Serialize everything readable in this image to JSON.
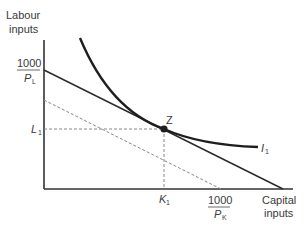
{
  "diagram": {
    "type": "isoquant-isocost",
    "y_axis_label_line1": "Labour",
    "y_axis_label_line2": "inputs",
    "x_axis_label_line1": "Capital",
    "x_axis_label_line2": "inputs",
    "y_intercept_numerator": "1000",
    "y_intercept_denominator": "P",
    "y_intercept_denominator_sub": "L",
    "x_intercept_numerator": "1000",
    "x_intercept_denominator": "P",
    "x_intercept_denominator_sub": "K",
    "labour_level_label": "L",
    "labour_level_sub": "1",
    "capital_level_label": "K",
    "capital_level_sub": "1",
    "point_label": "Z",
    "isoquant_label": "I",
    "isoquant_sub": "1",
    "colors": {
      "line": "#2a2a2a",
      "dashed": "#777777",
      "text": "#3a3a3a"
    }
  }
}
